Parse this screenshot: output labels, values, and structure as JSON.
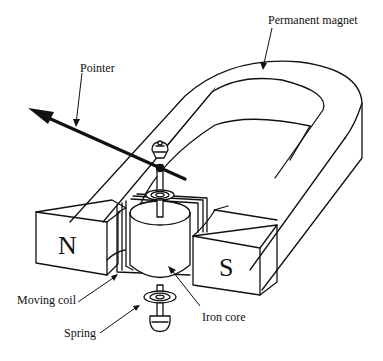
{
  "diagram": {
    "labels": {
      "permanent_magnet": "Permanent magnet",
      "pointer": "Pointer",
      "moving_coil": "Moving coil",
      "spring": "Spring",
      "iron_core": "Iron core"
    },
    "poles": {
      "north": "N",
      "south": "S"
    },
    "colors": {
      "line": "#111111",
      "background": "#ffffff"
    }
  }
}
